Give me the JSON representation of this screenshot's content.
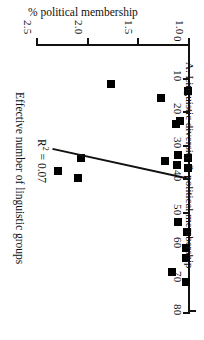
{
  "figure": {
    "panel_caption": "A. Linguistic diversity & political membership",
    "top_title": "% political membership",
    "y_axis_title": "Effective number of linguistic groups",
    "r2_prefix": "R",
    "r2_exponent": "2",
    "r2_value": "= 0.07",
    "r2_full": "R2 = 0.07"
  },
  "chart_data": {
    "type": "scatter",
    "title": "A. Linguistic diversity & political membership",
    "xlabel": "% political membership",
    "ylabel": "Effective number of linguistic groups",
    "orientation": "rotated-90-clockwise",
    "x_axis_position": "top",
    "y_axis_inverted": true,
    "grid": false,
    "legend": "none",
    "xlim": [
      0,
      80
    ],
    "ylim": [
      1.0,
      2.5
    ],
    "xticks": [
      0,
      10,
      20,
      30,
      40,
      50,
      60,
      70,
      80
    ],
    "xtick_labels": [
      "0",
      "10",
      "20",
      "30",
      "40",
      "50",
      "60",
      "70",
      "80"
    ],
    "yticks": [
      1.0,
      1.5,
      2.0,
      2.5
    ],
    "ytick_labels": [
      "1.0",
      "1.5",
      "2.0",
      "2.5"
    ],
    "annotations": [
      {
        "text": "R2 = 0.07",
        "x": 33,
        "y": 2.32
      }
    ],
    "marker": {
      "shape": "square",
      "color": "#000000"
    },
    "points": [
      {
        "x": 14,
        "y": 1.02
      },
      {
        "x": 34,
        "y": 1.02
      },
      {
        "x": 37,
        "y": 1.02
      },
      {
        "x": 56,
        "y": 1.03
      },
      {
        "x": 61,
        "y": 1.04
      },
      {
        "x": 64,
        "y": 1.04
      },
      {
        "x": 71,
        "y": 1.04
      },
      {
        "x": 23,
        "y": 1.1
      },
      {
        "x": 24,
        "y": 1.14
      },
      {
        "x": 33,
        "y": 1.12
      },
      {
        "x": 36,
        "y": 1.13
      },
      {
        "x": 53,
        "y": 1.12
      },
      {
        "x": 68,
        "y": 1.18
      },
      {
        "x": 35,
        "y": 1.25
      },
      {
        "x": 16,
        "y": 1.29
      },
      {
        "x": 12,
        "y": 1.78
      },
      {
        "x": 34,
        "y": 2.08
      },
      {
        "x": 40,
        "y": 2.11
      },
      {
        "x": 38,
        "y": 2.3
      }
    ],
    "trendline": {
      "r_squared": 0.07,
      "x_start": 40.5,
      "y_start": 1.0,
      "x_end": 31.5,
      "y_end": 2.36
    }
  }
}
